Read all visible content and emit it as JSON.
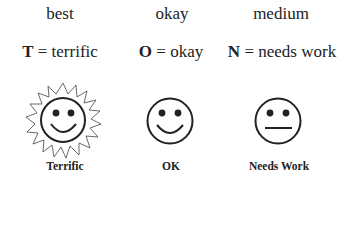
{
  "ratings": [
    {
      "level": "best",
      "letter": "T",
      "equals": " = ",
      "meaning": "terrific",
      "caption": "Terrific",
      "icon": "sun-smiley-icon"
    },
    {
      "level": "okay",
      "letter": "O",
      "equals": " = ",
      "meaning": "okay",
      "caption": "OK",
      "icon": "smiley-icon"
    },
    {
      "level": "medium",
      "letter": "N",
      "equals": " = ",
      "meaning": "needs work",
      "caption": "Needs Work",
      "icon": "neutral-face-icon"
    }
  ]
}
